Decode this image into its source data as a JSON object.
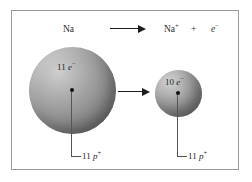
{
  "figure": {
    "background_color": "#ffffff",
    "frame_color": "#9a9a9a",
    "sphere_color": "#8f8f8f",
    "nucleus_color": "#111111",
    "arrow_color": "#1d1d1d",
    "leader_color": "#555555",
    "text_color": "#222222"
  },
  "equation": {
    "reactant": "Na",
    "arrow": "→",
    "product_ion_symbol": "Na",
    "product_ion_charge": "+",
    "operator": "+",
    "product_electron_symbol": "e",
    "product_electron_charge": "−"
  },
  "left_atom": {
    "name": "sodium-atom",
    "electron_count": "11",
    "electron_symbol": "e",
    "electron_charge": "−",
    "proton_count": "11",
    "proton_symbol": "p",
    "proton_charge": "+"
  },
  "right_atom": {
    "name": "sodium-ion",
    "electron_count": "10",
    "electron_symbol": "e",
    "electron_charge": "−",
    "proton_count": "11",
    "proton_symbol": "p",
    "proton_charge": "+"
  }
}
